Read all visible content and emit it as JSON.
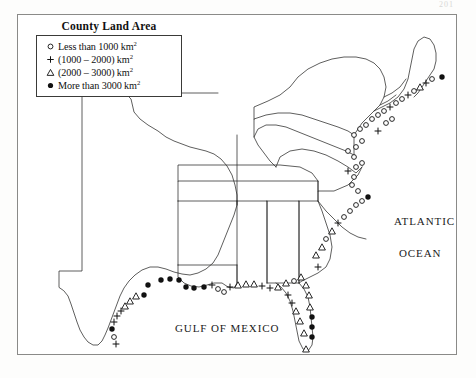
{
  "page": {
    "page_number": "201",
    "background_color": "#fdfdfc",
    "frame_color": "#8a8a88"
  },
  "legend": {
    "title": "County Land Area",
    "items": [
      {
        "symbol": "open-circle",
        "text_before": "Less than 1000 km",
        "exponent": "2",
        "text_after": ""
      },
      {
        "symbol": "plus",
        "text_before": "(1000 – 2000)  km",
        "exponent": "2",
        "text_after": ""
      },
      {
        "symbol": "open-triangle",
        "text_before": "(2000 – 3000)  km",
        "exponent": "2",
        "text_after": ""
      },
      {
        "symbol": "filled-circle",
        "text_before": "More than 3000 km",
        "exponent": "2",
        "text_after": ""
      }
    ]
  },
  "map": {
    "labels": {
      "atlantic": "ATLANTIC",
      "ocean": "OCEAN",
      "gulf": "GULF OF MEXICO"
    },
    "colors": {
      "coastline": "#1f1f1f",
      "state_border": "#2a2a28",
      "texas_panhandle_highlight": "#c08a3e",
      "marker": "#111111"
    }
  },
  "chart_data": {
    "type": "map",
    "title": "County Land Area",
    "legend_classes": [
      {
        "symbol": "open-circle",
        "label": "Less than 1000 km2",
        "min_km2": 0,
        "max_km2": 1000
      },
      {
        "symbol": "plus",
        "label": "(1000 - 2000) km2",
        "min_km2": 1000,
        "max_km2": 2000
      },
      {
        "symbol": "open-triangle",
        "label": "(2000 - 3000) km2",
        "min_km2": 2000,
        "max_km2": 3000
      },
      {
        "symbol": "filled-circle",
        "label": "More than 3000 km2",
        "min_km2": 3000,
        "max_km2": null
      }
    ],
    "annotations": [
      "ATLANTIC",
      "OCEAN",
      "GULF OF MEXICO"
    ],
    "regions_covered": [
      "Texas",
      "Louisiana",
      "Mississippi",
      "Alabama",
      "Georgia",
      "Florida",
      "South Carolina",
      "North Carolina",
      "Virginia",
      "Maryland",
      "Delaware",
      "New Jersey",
      "New York",
      "Connecticut",
      "Rhode Island",
      "Massachusetts",
      "New Hampshire",
      "Maine",
      "Pennsylvania",
      "West Virginia",
      "Tennessee",
      "Arkansas",
      "Oklahoma",
      "Vermont"
    ],
    "marker_counts_by_class": {
      "open-circle": 96,
      "plus": 58,
      "open-triangle": 54,
      "filled-circle": 31
    },
    "markers": [
      {
        "class": "filled-circle",
        "x": 130,
        "y": 270
      },
      {
        "class": "filled-circle",
        "x": 143,
        "y": 265
      },
      {
        "class": "filled-circle",
        "x": 152,
        "y": 264
      },
      {
        "class": "filled-circle",
        "x": 161,
        "y": 265
      },
      {
        "class": "filled-circle",
        "x": 126,
        "y": 280
      },
      {
        "class": "open-triangle",
        "x": 118,
        "y": 281
      },
      {
        "class": "open-triangle",
        "x": 112,
        "y": 286
      },
      {
        "class": "open-triangle",
        "x": 107,
        "y": 291
      },
      {
        "class": "plus",
        "x": 103,
        "y": 296
      },
      {
        "class": "plus",
        "x": 99,
        "y": 301
      },
      {
        "class": "plus",
        "x": 96,
        "y": 307
      },
      {
        "class": "filled-circle",
        "x": 94,
        "y": 314
      },
      {
        "class": "open-circle",
        "x": 96,
        "y": 322
      },
      {
        "class": "plus",
        "x": 98,
        "y": 329
      },
      {
        "class": "filled-circle",
        "x": 168,
        "y": 272
      },
      {
        "class": "filled-circle",
        "x": 176,
        "y": 273
      },
      {
        "class": "filled-circle",
        "x": 186,
        "y": 272
      },
      {
        "class": "plus",
        "x": 194,
        "y": 270
      },
      {
        "class": "open-circle",
        "x": 200,
        "y": 274
      },
      {
        "class": "open-circle",
        "x": 206,
        "y": 277
      },
      {
        "class": "plus",
        "x": 212,
        "y": 272
      },
      {
        "class": "open-triangle",
        "x": 220,
        "y": 270
      },
      {
        "class": "open-triangle",
        "x": 228,
        "y": 269
      },
      {
        "class": "open-triangle",
        "x": 236,
        "y": 269
      },
      {
        "class": "plus",
        "x": 244,
        "y": 271
      },
      {
        "class": "plus",
        "x": 252,
        "y": 273
      },
      {
        "class": "open-triangle",
        "x": 260,
        "y": 272
      },
      {
        "class": "open-triangle",
        "x": 268,
        "y": 268
      },
      {
        "class": "open-circle",
        "x": 276,
        "y": 266
      },
      {
        "class": "open-triangle",
        "x": 283,
        "y": 262
      },
      {
        "class": "open-triangle",
        "x": 288,
        "y": 270
      },
      {
        "class": "open-triangle",
        "x": 291,
        "y": 280
      },
      {
        "class": "open-triangle",
        "x": 292,
        "y": 292
      },
      {
        "class": "filled-circle",
        "x": 294,
        "y": 302
      },
      {
        "class": "filled-circle",
        "x": 294,
        "y": 312
      },
      {
        "class": "filled-circle",
        "x": 294,
        "y": 322
      },
      {
        "class": "open-triangle",
        "x": 286,
        "y": 318
      },
      {
        "class": "open-triangle",
        "x": 282,
        "y": 306
      },
      {
        "class": "open-triangle",
        "x": 278,
        "y": 296
      },
      {
        "class": "plus",
        "x": 274,
        "y": 288
      },
      {
        "class": "plus",
        "x": 270,
        "y": 280
      },
      {
        "class": "open-triangle",
        "x": 288,
        "y": 334
      },
      {
        "class": "open-triangle",
        "x": 298,
        "y": 240
      },
      {
        "class": "open-triangle",
        "x": 304,
        "y": 232
      },
      {
        "class": "plus",
        "x": 300,
        "y": 252
      },
      {
        "class": "open-circle",
        "x": 308,
        "y": 224
      },
      {
        "class": "open-triangle",
        "x": 314,
        "y": 216
      },
      {
        "class": "plus",
        "x": 320,
        "y": 208
      },
      {
        "class": "open-circle",
        "x": 326,
        "y": 202
      },
      {
        "class": "open-circle",
        "x": 332,
        "y": 196
      },
      {
        "class": "open-circle",
        "x": 338,
        "y": 190
      },
      {
        "class": "open-circle",
        "x": 344,
        "y": 186
      },
      {
        "class": "filled-circle",
        "x": 350,
        "y": 182
      },
      {
        "class": "open-circle",
        "x": 340,
        "y": 176
      },
      {
        "class": "open-circle",
        "x": 334,
        "y": 170
      },
      {
        "class": "open-circle",
        "x": 336,
        "y": 162
      },
      {
        "class": "plus",
        "x": 330,
        "y": 156
      },
      {
        "class": "open-circle",
        "x": 338,
        "y": 152
      },
      {
        "class": "open-circle",
        "x": 344,
        "y": 148
      },
      {
        "class": "open-circle",
        "x": 336,
        "y": 142
      },
      {
        "class": "open-circle",
        "x": 330,
        "y": 136
      },
      {
        "class": "open-circle",
        "x": 338,
        "y": 132
      },
      {
        "class": "open-circle",
        "x": 344,
        "y": 126
      },
      {
        "class": "open-circle",
        "x": 336,
        "y": 120
      },
      {
        "class": "open-circle",
        "x": 342,
        "y": 114
      },
      {
        "class": "open-circle",
        "x": 348,
        "y": 110
      },
      {
        "class": "open-circle",
        "x": 354,
        "y": 104
      },
      {
        "class": "open-circle",
        "x": 360,
        "y": 100
      },
      {
        "class": "open-circle",
        "x": 366,
        "y": 96
      },
      {
        "class": "plus",
        "x": 372,
        "y": 92
      },
      {
        "class": "open-circle",
        "x": 378,
        "y": 88
      },
      {
        "class": "open-circle",
        "x": 384,
        "y": 84
      },
      {
        "class": "plus",
        "x": 390,
        "y": 80
      },
      {
        "class": "open-circle",
        "x": 396,
        "y": 76
      },
      {
        "class": "open-triangle",
        "x": 402,
        "y": 72
      },
      {
        "class": "plus",
        "x": 408,
        "y": 68
      },
      {
        "class": "open-circle",
        "x": 414,
        "y": 64
      },
      {
        "class": "filled-circle",
        "x": 424,
        "y": 62
      },
      {
        "class": "open-circle",
        "x": 368,
        "y": 108
      },
      {
        "class": "open-circle",
        "x": 374,
        "y": 104
      },
      {
        "class": "plus",
        "x": 360,
        "y": 116
      }
    ]
  }
}
